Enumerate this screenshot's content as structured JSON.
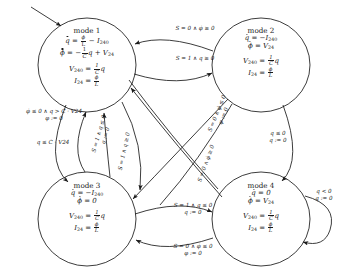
{
  "diagram": {
    "type": "state-transition-diagram",
    "stroke_color": "#1a1a1a",
    "background_color": "#ffffff",
    "nodes": [
      {
        "id": "mode1",
        "name": "mode 1",
        "cx": 87,
        "cy": 65,
        "rx": 49,
        "ry": 47,
        "flow": [
          "q̇ = φ/L − I240",
          "φ̇ = −(1/C)q + V24"
        ],
        "output": [
          "V240 = (1/C)q",
          "I24 = φ/L"
        ]
      },
      {
        "id": "mode2",
        "name": "mode 2",
        "cx": 261,
        "cy": 65,
        "rx": 49,
        "ry": 47,
        "flow": [
          "q̇ = −I240",
          "φ̇ = V24"
        ],
        "output": [
          "V240 = (1/C)q",
          "I24 = φ/L"
        ]
      },
      {
        "id": "mode3",
        "name": "mode 3",
        "cx": 87,
        "cy": 219,
        "rx": 49,
        "ry": 47,
        "flow": [
          "q̇ = −I240",
          "φ̇ = 0"
        ],
        "output": [
          "V240 = (1/C)q",
          "I24 = φ/L"
        ]
      },
      {
        "id": "mode4",
        "name": "mode 4",
        "cx": 261,
        "cy": 219,
        "rx": 49,
        "ry": 47,
        "flow": [
          "q̇ = 0",
          "φ̇ = V24"
        ],
        "output": [
          "V240 = (1/C)q",
          "I24 = φ/L"
        ]
      }
    ],
    "transitions": [
      {
        "id": "t_2to1_top",
        "from": "mode2",
        "to": "mode1",
        "guard": "S = 0 ∧ φ̇ ≥ 0",
        "reset": ""
      },
      {
        "id": "t_1to2",
        "from": "mode1",
        "to": "mode2",
        "guard": "S = 1 ∧ q ≥ 0",
        "reset": ""
      },
      {
        "id": "t_3to4",
        "from": "mode3",
        "to": "mode4",
        "guard": "S = 1 ∧ q ≤ 0",
        "reset": "q := 0"
      },
      {
        "id": "t_4to3",
        "from": "mode4",
        "to": "mode3",
        "guard": "S = 0 ∧ φ̇ ≤ 0",
        "reset": "φ := 0"
      },
      {
        "id": "t_1to3_left",
        "from": "mode1",
        "to": "mode3",
        "guard": "φ̇ ≤ 0 ∧ q > C · V24",
        "reset": "φ := 0"
      },
      {
        "id": "t_3to1_left",
        "from": "mode3",
        "to": "mode1",
        "guard": "q ≤ C · V24",
        "reset": ""
      },
      {
        "id": "t_2to4_right",
        "from": "mode2",
        "to": "mode4",
        "guard": "q ≤ 0",
        "reset": "q := 0"
      },
      {
        "id": "t_diag_3to1",
        "from": "mode3",
        "to": "mode1",
        "guard": "S = 1 ∧ q ≤ 0",
        "reset": "q := 0"
      },
      {
        "id": "t_diag_1to3",
        "from": "mode1",
        "to": "mode3",
        "guard": "S = 1 ∧ q ≥ 0",
        "reset": ""
      },
      {
        "id": "t_diag_2to3",
        "from": "mode2",
        "to": "mode3",
        "guard": "S = 0 ∧ φ̇ ≤ 0",
        "reset": "φ := 0"
      },
      {
        "id": "t_diag_4to2",
        "from": "mode4",
        "to": "mode2",
        "guard": "S = 0 ∧ φ̇ ≥ 0",
        "reset": ""
      },
      {
        "id": "t_self_4",
        "from": "mode4",
        "to": "mode4",
        "guard": "q < 0",
        "reset": "q := 0"
      }
    ],
    "initial_arrow": {
      "target": "mode1",
      "from_x": 30,
      "from_y": 6,
      "to_x": 63,
      "to_y": 27
    },
    "symbols": {
      "and": "∧",
      "assign": ":=",
      "leq": "≤",
      "geq": "≥",
      "dot_marker": "overdot-derivative"
    }
  }
}
